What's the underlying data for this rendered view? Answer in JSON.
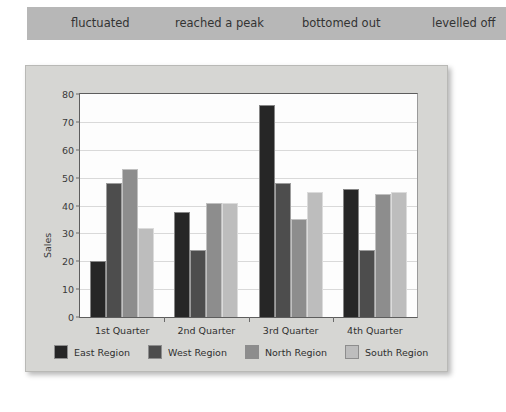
{
  "phrase_bar": {
    "background": "#b7b7b7",
    "phrases": [
      "fluctuated",
      "reached a peak",
      "bottomed out",
      "levelled off"
    ]
  },
  "chart_data": {
    "type": "bar",
    "title": "",
    "xlabel": "",
    "ylabel": "Sales",
    "ylim": [
      0,
      80
    ],
    "y_ticks": [
      0,
      10,
      20,
      30,
      40,
      50,
      60,
      70,
      80
    ],
    "grid": true,
    "legend_position": "bottom",
    "categories": [
      "1st Quarter",
      "2nd Quarter",
      "3rd Quarter",
      "4th Quarter"
    ],
    "series": [
      {
        "name": "East Region",
        "color": "#262626",
        "values": [
          20,
          37.5,
          76,
          46
        ]
      },
      {
        "name": "West Region",
        "color": "#4d4d4d",
        "values": [
          48,
          24,
          48,
          24
        ]
      },
      {
        "name": "North Region",
        "color": "#8d8d8d",
        "values": [
          53,
          41,
          35,
          44
        ]
      },
      {
        "name": "South Region",
        "color": "#bdbdbd",
        "values": [
          32,
          41,
          45,
          45
        ]
      }
    ]
  },
  "chart_card": {
    "background": "#d6d6d3",
    "plot_background": "#fdfdfd"
  }
}
